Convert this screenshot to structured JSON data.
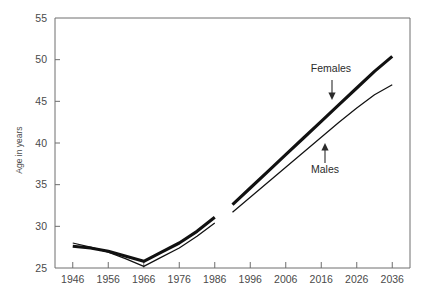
{
  "chart_data": {
    "type": "line",
    "title": "",
    "subtitle": "",
    "xlabel": "",
    "ylabel": "Age in years",
    "xlim": [
      1941,
      2041
    ],
    "ylim": [
      25,
      55
    ],
    "xticks": [
      "1946",
      "1956",
      "1966",
      "1976",
      "1986",
      "1996",
      "2006",
      "2016",
      "2026",
      "2036"
    ],
    "yticks": [
      "25",
      "30",
      "35",
      "40",
      "45",
      "50",
      "55"
    ],
    "grid": false,
    "legend_position": "inline-annotations",
    "annotations": [
      {
        "text": "Females",
        "points_to": "females-series",
        "arrow": "down"
      },
      {
        "text": "Males",
        "points_to": "males-series",
        "arrow": "up"
      }
    ],
    "series": [
      {
        "name": "Females",
        "style": "thick",
        "segments": [
          {
            "name": "observed",
            "x": [
              1946,
              1951,
              1956,
              1961,
              1966,
              1971,
              1976,
              1981,
              1986
            ],
            "y": [
              27.6,
              27.4,
              27.0,
              26.4,
              25.8,
              26.9,
              28.0,
              29.4,
              31.1
            ]
          },
          {
            "name": "projected",
            "x": [
              1991,
              1996,
              2001,
              2006,
              2011,
              2016,
              2021,
              2026,
              2031,
              2036
            ],
            "y": [
              32.6,
              34.6,
              36.6,
              38.6,
              40.6,
              42.6,
              44.6,
              46.6,
              48.6,
              50.4
            ]
          }
        ]
      },
      {
        "name": "Males",
        "style": "thin",
        "segments": [
          {
            "name": "observed",
            "x": [
              1946,
              1951,
              1956,
              1961,
              1966,
              1971,
              1976,
              1981,
              1986
            ],
            "y": [
              28.0,
              27.5,
              26.9,
              26.1,
              25.2,
              26.3,
              27.4,
              28.8,
              30.4
            ]
          },
          {
            "name": "projected",
            "x": [
              1991,
              1996,
              2001,
              2006,
              2011,
              2016,
              2021,
              2026,
              2031,
              2036
            ],
            "y": [
              31.7,
              33.5,
              35.3,
              37.1,
              38.9,
              40.7,
              42.5,
              44.2,
              45.8,
              47.0
            ]
          }
        ]
      }
    ]
  },
  "axis": {
    "y_title": "Age in years"
  },
  "labels": {
    "females": "Females",
    "males": "Males"
  }
}
